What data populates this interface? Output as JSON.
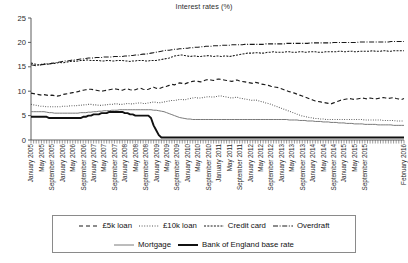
{
  "chart_data": {
    "type": "line",
    "title": "Interest rates (%)",
    "xlabel": "",
    "ylabel": "",
    "ylim": [
      0,
      25
    ],
    "yticks": [
      0,
      5,
      10,
      15,
      20,
      25
    ],
    "grid": false,
    "legend_position": "bottom",
    "x_tick_interval_months": 4,
    "x_minor_tick_interval_months": 1,
    "x_start": "January 2005",
    "x_end": "February 2016",
    "x_tick_labels": [
      "January 2005",
      "May 2005",
      "September 2005",
      "January 2006",
      "May 2006",
      "September 2006",
      "January 2007",
      "May 2007",
      "September 2007",
      "January 2008",
      "May 2008",
      "September 2008",
      "January 2009",
      "May 2009",
      "September 2009",
      "January 2010",
      "May 2010",
      "September 2010",
      "January 2011",
      "May 2011",
      "September 2011",
      "January 2012",
      "May 2012",
      "September 2012",
      "January 2013",
      "May 2013",
      "September 2013",
      "January 2014",
      "May 2014",
      "September 2014",
      "January 2015",
      "May 2015",
      "September 2015",
      "February 2016"
    ],
    "series": [
      {
        "name": "£5k loan",
        "style": "dashed",
        "color": "#1a1a1a",
        "values": [
          9.6,
          9.5,
          9.4,
          9.3,
          9.2,
          9.3,
          9.2,
          9.1,
          9.2,
          9.1,
          9.0,
          9.1,
          9.3,
          9.4,
          9.5,
          9.6,
          9.7,
          9.8,
          9.9,
          10.1,
          10.2,
          10.3,
          10.4,
          10.4,
          10.3,
          10.2,
          10.1,
          10.0,
          10.1,
          10.2,
          10.3,
          10.4,
          10.5,
          10.4,
          10.3,
          10.2,
          10.4,
          10.5,
          10.3,
          10.2,
          10.3,
          10.5,
          10.6,
          10.4,
          10.3,
          10.4,
          10.6,
          10.8,
          10.6,
          10.5,
          10.7,
          10.9,
          11.0,
          11.2,
          11.4,
          11.3,
          11.5,
          11.7,
          11.6,
          11.5,
          11.7,
          11.9,
          12.0,
          12.1,
          12.0,
          11.9,
          12.1,
          12.3,
          12.4,
          12.3,
          12.2,
          12.4,
          12.5,
          12.4,
          12.3,
          12.2,
          12.1,
          12.0,
          12.2,
          12.3,
          12.1,
          12.0,
          11.9,
          11.8,
          11.7,
          11.6,
          11.8,
          11.7,
          11.5,
          11.4,
          11.3,
          11.2,
          11.0,
          10.9,
          10.8,
          10.7,
          10.5,
          10.3,
          10.1,
          9.9,
          9.8,
          9.6,
          9.4,
          9.2,
          9.0,
          8.8,
          8.6,
          8.4,
          8.2,
          8.0,
          7.9,
          7.8,
          7.7,
          7.6,
          7.5,
          7.4,
          7.6,
          7.8,
          8.0,
          8.2,
          8.3,
          8.4,
          8.5,
          8.4,
          8.3,
          8.4,
          8.5,
          8.6,
          8.5,
          8.4,
          8.6,
          8.5,
          8.4,
          8.5,
          8.6,
          8.7,
          8.6,
          8.5,
          8.6,
          8.7,
          8.5,
          8.4,
          8.3,
          8.5
        ]
      },
      {
        "name": "£10k loan",
        "style": "dotted",
        "color": "#555555",
        "values": [
          7.3,
          7.2,
          7.1,
          7.0,
          6.9,
          6.9,
          6.8,
          6.8,
          6.8,
          6.8,
          6.8,
          6.8,
          6.9,
          6.9,
          6.9,
          7.0,
          7.0,
          7.0,
          7.1,
          7.1,
          7.2,
          7.2,
          7.3,
          7.3,
          7.2,
          7.2,
          7.1,
          7.1,
          7.2,
          7.2,
          7.3,
          7.3,
          7.4,
          7.4,
          7.3,
          7.3,
          7.4,
          7.5,
          7.4,
          7.4,
          7.5,
          7.6,
          7.6,
          7.5,
          7.5,
          7.6,
          7.7,
          7.8,
          7.7,
          7.6,
          7.7,
          7.8,
          7.9,
          8.0,
          8.1,
          8.1,
          8.2,
          8.3,
          8.3,
          8.2,
          8.4,
          8.5,
          8.6,
          8.7,
          8.6,
          8.6,
          8.7,
          8.8,
          8.9,
          8.8,
          8.8,
          8.9,
          9.0,
          9.0,
          8.9,
          8.8,
          8.7,
          8.6,
          8.7,
          8.8,
          8.6,
          8.5,
          8.4,
          8.3,
          8.2,
          8.1,
          8.2,
          8.1,
          7.9,
          7.8,
          7.6,
          7.5,
          7.3,
          7.1,
          6.9,
          6.7,
          6.5,
          6.3,
          6.1,
          5.9,
          5.7,
          5.5,
          5.3,
          5.1,
          4.9,
          4.8,
          4.7,
          4.6,
          4.5,
          4.4,
          4.4,
          4.3,
          4.3,
          4.2,
          4.2,
          4.2,
          4.2,
          4.2,
          4.2,
          4.2,
          4.2,
          4.2,
          4.2,
          4.2,
          4.2,
          4.2,
          4.2,
          4.2,
          4.1,
          4.1,
          4.1,
          4.1,
          4.1,
          4.1,
          4.1,
          4.0,
          4.0,
          4.0,
          4.0,
          4.0,
          3.9,
          3.9,
          3.9,
          3.9
        ]
      },
      {
        "name": "Credit card",
        "style": "fine-dash",
        "color": "#1a1a1a",
        "values": [
          15.8,
          15.6,
          15.5,
          15.4,
          15.5,
          15.6,
          15.5,
          15.6,
          15.7,
          15.7,
          15.8,
          15.9,
          15.8,
          15.9,
          16.0,
          16.1,
          16.2,
          16.1,
          16.2,
          16.3,
          16.3,
          16.4,
          16.4,
          16.3,
          16.3,
          16.3,
          16.3,
          16.2,
          16.2,
          16.3,
          16.3,
          16.2,
          16.2,
          16.3,
          16.3,
          16.3,
          16.2,
          16.2,
          16.1,
          16.2,
          16.2,
          16.3,
          16.3,
          16.3,
          16.2,
          16.2,
          16.3,
          16.3,
          16.3,
          16.4,
          16.5,
          16.6,
          16.7,
          16.8,
          17.0,
          17.2,
          17.3,
          17.4,
          17.4,
          17.3,
          17.2,
          17.1,
          17.2,
          17.2,
          17.1,
          17.1,
          17.2,
          17.2,
          17.3,
          17.2,
          17.1,
          17.2,
          17.2,
          17.1,
          17.2,
          17.2,
          17.1,
          17.2,
          17.3,
          17.4,
          17.5,
          17.6,
          17.7,
          17.8,
          17.8,
          17.8,
          17.9,
          17.9,
          17.8,
          17.8,
          17.9,
          18.0,
          18.0,
          18.1,
          18.0,
          18.0,
          18.0,
          18.0,
          18.1,
          18.1,
          18.0,
          18.0,
          18.0,
          18.1,
          18.1,
          18.0,
          18.0,
          18.1,
          18.1,
          18.1,
          18.0,
          18.0,
          18.0,
          18.1,
          18.1,
          18.1,
          18.1,
          18.1,
          18.2,
          18.2,
          18.1,
          18.1,
          18.2,
          18.2,
          18.1,
          18.1,
          18.2,
          18.2,
          18.2,
          18.2,
          18.2,
          18.3,
          18.2,
          18.2,
          18.2,
          18.3,
          18.3,
          18.2,
          18.2,
          18.3,
          18.3,
          18.3,
          18.3,
          18.3
        ]
      },
      {
        "name": "Overdraft",
        "style": "dash-dot",
        "color": "#1a1a1a",
        "values": [
          15.4,
          15.3,
          15.2,
          15.3,
          15.4,
          15.5,
          15.6,
          15.6,
          15.7,
          15.8,
          15.9,
          16.0,
          16.1,
          16.2,
          16.2,
          16.3,
          16.4,
          16.4,
          16.5,
          16.6,
          16.6,
          16.7,
          16.8,
          16.8,
          16.8,
          16.9,
          16.9,
          16.9,
          17.0,
          17.0,
          17.0,
          17.0,
          17.1,
          17.1,
          17.1,
          17.1,
          17.2,
          17.2,
          17.3,
          17.3,
          17.4,
          17.4,
          17.5,
          17.6,
          17.6,
          17.7,
          17.8,
          17.9,
          18.0,
          18.1,
          18.2,
          18.3,
          18.4,
          18.4,
          18.5,
          18.6,
          18.6,
          18.7,
          18.7,
          18.8,
          18.8,
          18.9,
          18.9,
          19.0,
          19.0,
          19.1,
          19.1,
          19.2,
          19.2,
          19.2,
          19.3,
          19.3,
          19.3,
          19.4,
          19.4,
          19.4,
          19.4,
          19.5,
          19.5,
          19.5,
          19.5,
          19.5,
          19.6,
          19.6,
          19.6,
          19.6,
          19.6,
          19.6,
          19.6,
          19.6,
          19.7,
          19.7,
          19.7,
          19.7,
          19.7,
          19.7,
          19.7,
          19.7,
          19.8,
          19.8,
          19.8,
          19.8,
          19.8,
          19.8,
          19.8,
          19.8,
          19.8,
          19.9,
          19.9,
          19.9,
          19.9,
          19.9,
          19.9,
          19.9,
          19.9,
          19.9,
          20.0,
          20.0,
          20.0,
          20.0,
          20.0,
          20.0,
          20.0,
          20.0,
          20.0,
          20.0,
          20.1,
          20.1,
          20.1,
          20.1,
          20.1,
          20.1,
          20.1,
          20.1,
          20.1,
          20.1,
          20.1,
          20.1,
          20.2,
          20.2,
          20.2,
          20.2,
          20.2,
          20.2
        ]
      },
      {
        "name": "Mortgage",
        "style": "thin-solid",
        "color": "#7a7a7a",
        "values": [
          5.8,
          5.8,
          5.8,
          5.8,
          5.8,
          5.8,
          5.7,
          5.6,
          5.6,
          5.5,
          5.5,
          5.5,
          5.5,
          5.5,
          5.5,
          5.5,
          5.5,
          5.5,
          5.5,
          5.6,
          5.6,
          5.6,
          5.7,
          5.7,
          5.8,
          5.8,
          5.9,
          5.9,
          6.0,
          6.0,
          6.0,
          6.1,
          6.1,
          6.1,
          6.2,
          6.2,
          6.2,
          6.2,
          6.2,
          6.2,
          6.2,
          6.2,
          6.2,
          6.2,
          6.2,
          6.2,
          6.2,
          6.1,
          6.1,
          6.0,
          5.9,
          5.8,
          5.6,
          5.4,
          5.2,
          5.0,
          4.8,
          4.6,
          4.5,
          4.4,
          4.3,
          4.3,
          4.2,
          4.2,
          4.2,
          4.2,
          4.2,
          4.2,
          4.2,
          4.2,
          4.2,
          4.2,
          4.2,
          4.2,
          4.2,
          4.2,
          4.2,
          4.2,
          4.2,
          4.2,
          4.2,
          4.2,
          4.2,
          4.2,
          4.2,
          4.2,
          4.2,
          4.2,
          4.2,
          4.2,
          4.2,
          4.2,
          4.2,
          4.2,
          4.2,
          4.2,
          4.2,
          4.2,
          4.2,
          4.1,
          4.1,
          4.1,
          4.1,
          4.0,
          4.0,
          4.0,
          3.9,
          3.9,
          3.9,
          3.8,
          3.8,
          3.8,
          3.7,
          3.7,
          3.7,
          3.6,
          3.6,
          3.6,
          3.5,
          3.5,
          3.5,
          3.4,
          3.4,
          3.4,
          3.3,
          3.3,
          3.3,
          3.3,
          3.2,
          3.2,
          3.2,
          3.2,
          3.2,
          3.1,
          3.1,
          3.1,
          3.1,
          3.1,
          3.1,
          3.0,
          3.0,
          3.0,
          3.0,
          3.0
        ]
      },
      {
        "name": "Bank of England base rate",
        "style": "thick-solid",
        "color": "#111111",
        "values": [
          4.75,
          4.75,
          4.75,
          4.75,
          4.75,
          4.75,
          4.75,
          4.5,
          4.5,
          4.5,
          4.5,
          4.5,
          4.5,
          4.5,
          4.5,
          4.5,
          4.5,
          4.5,
          4.5,
          4.5,
          4.75,
          4.75,
          5.0,
          5.0,
          5.25,
          5.25,
          5.25,
          5.5,
          5.5,
          5.5,
          5.75,
          5.75,
          5.75,
          5.75,
          5.75,
          5.75,
          5.5,
          5.5,
          5.25,
          5.25,
          5.0,
          5.0,
          5.0,
          5.0,
          5.0,
          5.0,
          4.5,
          3.0,
          2.0,
          1.0,
          0.5,
          0.5,
          0.5,
          0.5,
          0.5,
          0.5,
          0.5,
          0.5,
          0.5,
          0.5,
          0.5,
          0.5,
          0.5,
          0.5,
          0.5,
          0.5,
          0.5,
          0.5,
          0.5,
          0.5,
          0.5,
          0.5,
          0.5,
          0.5,
          0.5,
          0.5,
          0.5,
          0.5,
          0.5,
          0.5,
          0.5,
          0.5,
          0.5,
          0.5,
          0.5,
          0.5,
          0.5,
          0.5,
          0.5,
          0.5,
          0.5,
          0.5,
          0.5,
          0.5,
          0.5,
          0.5,
          0.5,
          0.5,
          0.5,
          0.5,
          0.5,
          0.5,
          0.5,
          0.5,
          0.5,
          0.5,
          0.5,
          0.5,
          0.5,
          0.5,
          0.5,
          0.5,
          0.5,
          0.5,
          0.5,
          0.5,
          0.5,
          0.5,
          0.5,
          0.5,
          0.5,
          0.5,
          0.5,
          0.5,
          0.5,
          0.5,
          0.5,
          0.5,
          0.5,
          0.5,
          0.5,
          0.5,
          0.5,
          0.5,
          0.5,
          0.5,
          0.5,
          0.5,
          0.5,
          0.5,
          0.5,
          0.5,
          0.5,
          0.5
        ]
      }
    ]
  },
  "legend": {
    "rows": [
      [
        "£5k loan",
        "£10k loan",
        "Credit card",
        "Overdraft"
      ],
      [
        "Mortgage",
        "Bank of England base rate"
      ]
    ]
  }
}
